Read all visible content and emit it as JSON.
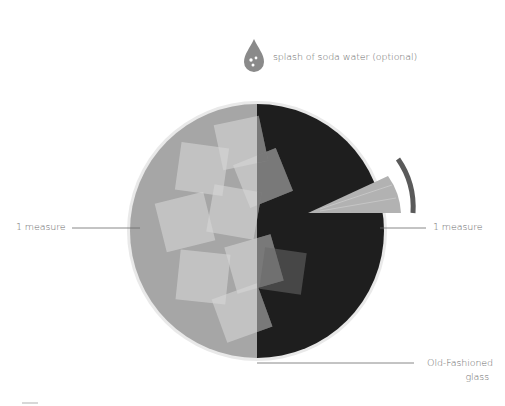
{
  "diagram": {
    "type": "cocktail-recipe-illustration",
    "glass": {
      "label_line1": "Old-Fashioned",
      "label_line2": "glass"
    },
    "ingredients": [
      {
        "name": "left-spirit",
        "label": "1 measure",
        "color": "#a6a6a6"
      },
      {
        "name": "right-spirit",
        "label": "1 measure",
        "color": "#1e1e1e"
      }
    ],
    "optional": {
      "label": "splash of soda water (optional)",
      "icon": "water-drop-icon",
      "color": "#8a8a8a"
    },
    "garnish": {
      "icon": "citrus-wedge-icon",
      "slice_color": "#b2b2b2",
      "peel_color": "#5a5a5a"
    },
    "ice": {
      "icon": "ice-cube-icon",
      "count": 8
    }
  }
}
